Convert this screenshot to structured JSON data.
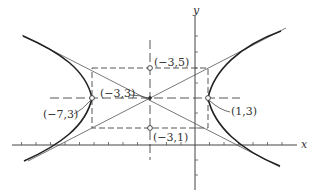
{
  "figure": {
    "type": "hyperbola-diagram",
    "axes": {
      "x_label": "x",
      "y_label": "y"
    },
    "center": {
      "label": "(−3,3)",
      "x": -3,
      "y": 3
    },
    "vertices": [
      {
        "label": "(−7,3)",
        "x": -7,
        "y": 3
      },
      {
        "label": "(1,3)",
        "x": 1,
        "y": 3
      }
    ],
    "conjugate_points": [
      {
        "label": "(−3,5)",
        "x": -3,
        "y": 5
      },
      {
        "label": "(−3,1)",
        "x": -3,
        "y": 1
      }
    ],
    "fundamental_rectangle": {
      "x_min": -7,
      "x_max": 1,
      "y_min": 1,
      "y_max": 5
    },
    "asymptotes": "lines through center and rectangle corners",
    "colors": {
      "curve": "#222222",
      "asymptote": "#555555",
      "axis": "#444444",
      "dashed": "#444444"
    }
  }
}
